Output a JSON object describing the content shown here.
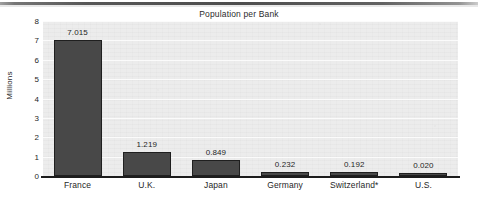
{
  "chart_data": {
    "type": "bar",
    "title": "Population per Bank",
    "xlabel": "",
    "ylabel": "Millions",
    "categories": [
      "France",
      "U.K.",
      "Japan",
      "Germany",
      "Switzerland*",
      "U.S."
    ],
    "values": [
      7.015,
      1.219,
      0.849,
      0.232,
      0.192,
      0.02
    ],
    "value_labels": [
      "7.015",
      "1.219",
      "0.849",
      "0.232",
      "0.192",
      "0.020"
    ],
    "ylim": [
      0,
      8
    ],
    "yticks": [
      0,
      1,
      2,
      3,
      4,
      5,
      6,
      7,
      8
    ],
    "ytick_labels": [
      "0",
      "1",
      "2",
      "3",
      "4",
      "5",
      "6",
      "7",
      "8"
    ],
    "grid": true,
    "legend": false,
    "legend_position": "none",
    "bar_color": "#484848",
    "bar_edge_color": "#1f1f1f",
    "plot_background": "#ececec",
    "figure_background": "#ffffff",
    "axis_color": "#1c1c1c",
    "text_color": "#1f1f1f",
    "gridline_color": "#fbfbfb",
    "footnote_marker": "*"
  }
}
